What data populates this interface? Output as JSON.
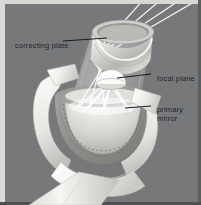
{
  "figure": {
    "background_color": "#77787a",
    "mat_color": "#d9d9d6",
    "label_color": "#111315"
  },
  "labels": [
    {
      "id": "correcting-plate",
      "text": "correcting plate",
      "leader": "line from text right edge to telescope top aperture"
    },
    {
      "id": "focal-plane",
      "text": "focal plane",
      "leader": "line from text left edge to small dome inside tube"
    },
    {
      "id": "primary-mirror",
      "line1": "primary",
      "line2": "mirror",
      "leader": "line from text left edge to mirror bowl rim"
    }
  ],
  "parts": {
    "correcting_plate_label": "correcting plate",
    "focal_plane_label": "focal plane",
    "primary_mirror_label_line1": "primary",
    "primary_mirror_label_line2": "mirror",
    "tube": "transparent cylindrical optical tube",
    "fork_mount": "white fork mount arms",
    "pier": "white tapering pier",
    "light_rays": "incoming starlight rays converging"
  },
  "colors": {
    "white_body": "#f2f2ef",
    "white_shade": "#d3d4d1",
    "mirror_gray": "#8a8b88",
    "glass": "#b8bab7",
    "ray": "#ffffff"
  }
}
